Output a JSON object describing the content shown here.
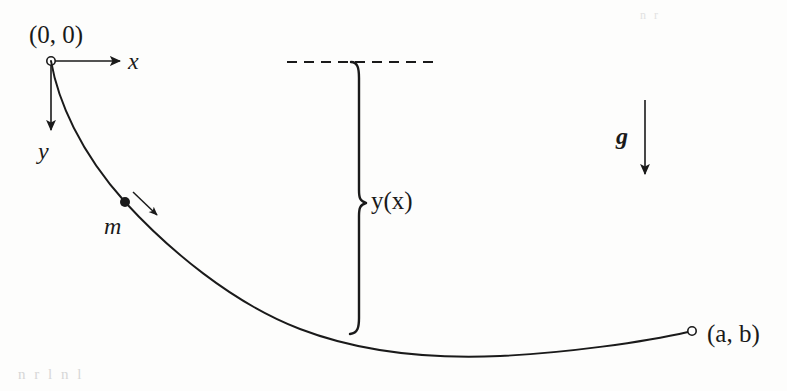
{
  "figure": {
    "background_color": "#fdfdfc",
    "ink_color": "#1a1a1a",
    "width": 787,
    "height": 391
  },
  "labels": {
    "origin": "(0, 0)",
    "x_axis": "x",
    "y_axis": "y",
    "mass": "m",
    "depth_function": "y(x)",
    "gravity": "g",
    "endpoint": "(a, b)"
  },
  "elements": {
    "origin_marker": "open-circle-marker",
    "endpoint_marker": "open-circle-marker",
    "mass_marker": "filled-dot-marker",
    "x_axis_arrow": "arrow-right",
    "y_axis_arrow": "arrow-down",
    "gravity_arrow": "arrow-down",
    "motion_arrow": "arrow-down-right",
    "reference_line": "dashed-horizontal-line",
    "depth_brace": "right-curly-brace"
  },
  "geometry": {
    "origin": [
      51,
      61
    ],
    "endpoint": [
      692,
      331
    ],
    "mass_point": [
      125,
      202
    ],
    "curve_minimum": [
      500,
      355
    ],
    "x_axis_arrow_tip": [
      122,
      61
    ],
    "y_axis_arrow_tip": [
      51,
      132
    ],
    "gravity_arrow_start": [
      645,
      100
    ],
    "gravity_arrow_tip": [
      645,
      177
    ],
    "dashed_line_y": 62,
    "dashed_line_x_start": 287,
    "dashed_line_x_end": 433,
    "brace_x": 359,
    "brace_top_y": 62,
    "brace_bottom_y": 334
  },
  "scan_artifacts": {
    "bottom_bleed": "n      r     l     n   l",
    "top_bleed": "n   r"
  }
}
